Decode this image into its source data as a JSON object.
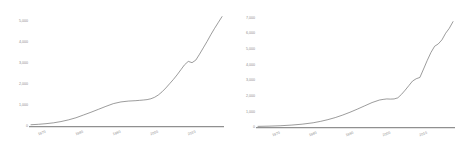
{
  "chart_data": [
    {
      "type": "line",
      "title": "",
      "xlabel": "",
      "ylabel": "",
      "grid": false,
      "legend": null,
      "axis_color": "#909090",
      "line_color": "#5f5f5f",
      "tick_color": "#8d8d8d",
      "xlim": [
        1967,
        2018
      ],
      "ylim": [
        0,
        5400
      ],
      "yticks": [
        0,
        1000,
        2000,
        3000,
        4000,
        5000
      ],
      "ytick_labels": [
        "0",
        "1,000",
        "2,000",
        "3,000",
        "4,000",
        "5,000"
      ],
      "xticks": [
        1970,
        1980,
        1990,
        2000,
        2010
      ],
      "xtick_labels": [
        "1970",
        "1980",
        "1990",
        "2000",
        "2010"
      ],
      "x": [
        1967,
        1969,
        1971,
        1973,
        1975,
        1977,
        1979,
        1981,
        1983,
        1985,
        1987,
        1989,
        1991,
        1993,
        1995,
        1996,
        1997,
        1998,
        1999,
        2000,
        2001,
        2002,
        2003,
        2004,
        2005,
        2006,
        2007,
        2008,
        2009,
        2010,
        2011,
        2012,
        2013,
        2014,
        2015,
        2016,
        2017,
        2018
      ],
      "values": [
        60,
        80,
        110,
        150,
        210,
        290,
        390,
        520,
        650,
        790,
        930,
        1060,
        1140,
        1180,
        1200,
        1215,
        1230,
        1250,
        1290,
        1360,
        1470,
        1620,
        1800,
        2000,
        2200,
        2420,
        2660,
        2900,
        3060,
        3000,
        3120,
        3400,
        3700,
        4000,
        4320,
        4620,
        4900,
        5180
      ]
    },
    {
      "type": "line",
      "title": "",
      "xlabel": "",
      "ylabel": "",
      "grid": false,
      "legend": null,
      "axis_color": "#909090",
      "line_color": "#5f5f5f",
      "tick_color": "#8d8d8d",
      "xlim": [
        1965,
        2018
      ],
      "ylim": [
        0,
        7400
      ],
      "yticks": [
        0,
        1000,
        2000,
        3000,
        4000,
        5000,
        6000,
        7000
      ],
      "ytick_labels": [
        "0",
        "1,000",
        "2,000",
        "3,000",
        "4,000",
        "5,000",
        "6,000",
        "7,000"
      ],
      "xticks": [
        1970,
        1980,
        1990,
        2000,
        2010
      ],
      "xtick_labels": [
        "1970",
        "1980",
        "1990",
        "2000",
        "2010"
      ],
      "x": [
        1965,
        1968,
        1971,
        1974,
        1977,
        1980,
        1982,
        1984,
        1986,
        1988,
        1990,
        1992,
        1994,
        1996,
        1998,
        1999,
        2000,
        2001,
        2002,
        2003,
        2004,
        2005,
        2006,
        2007,
        2008,
        2009,
        2010,
        2011,
        2012,
        2013,
        2014,
        2015,
        2016,
        2017,
        2018
      ],
      "values": [
        40,
        55,
        80,
        120,
        180,
        270,
        360,
        470,
        600,
        760,
        940,
        1140,
        1350,
        1560,
        1720,
        1760,
        1790,
        1780,
        1790,
        1860,
        2080,
        2350,
        2640,
        2930,
        3080,
        3160,
        3700,
        4250,
        4750,
        5150,
        5300,
        5560,
        5980,
        6300,
        6720
      ]
    }
  ]
}
